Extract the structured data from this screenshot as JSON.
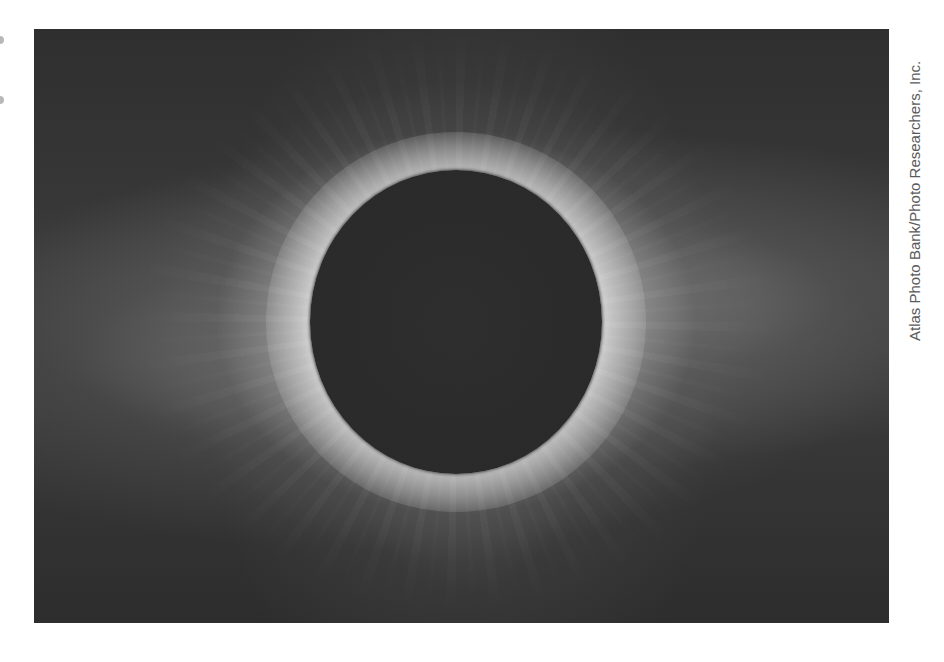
{
  "figure": {
    "photo_tone": "grayscale",
    "credit": "Atlas Photo Bank/Photo Researchers, Inc."
  },
  "colors": {
    "background": "#ffffff",
    "sky": "#2b2b2b",
    "corona": "#f5f5f5",
    "moon": "#2a2a2a",
    "credit_text": "#5a5a5a"
  }
}
